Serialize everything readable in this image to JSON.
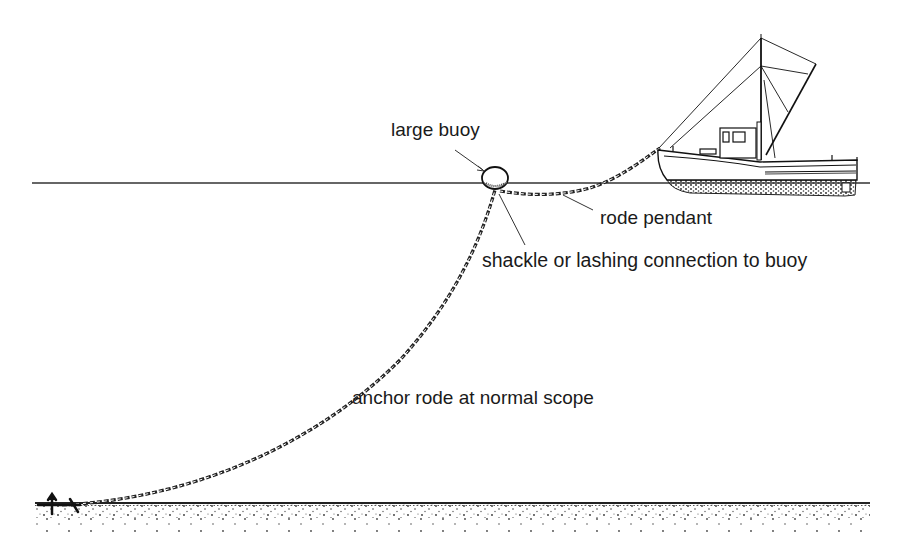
{
  "diagram": {
    "labels": {
      "large_buoy": "large buoy",
      "rode_pendant": "rode pendant",
      "shackle": "shackle or lashing connection to buoy",
      "anchor_rode": "anchor rode at normal scope"
    },
    "elements": [
      "water-surface",
      "large-buoy",
      "rode-pendant",
      "anchor-rode-chain",
      "anchor",
      "seabed",
      "fishing-boat"
    ],
    "colors": {
      "ink": "#1a1a1a",
      "background": "#ffffff"
    }
  }
}
